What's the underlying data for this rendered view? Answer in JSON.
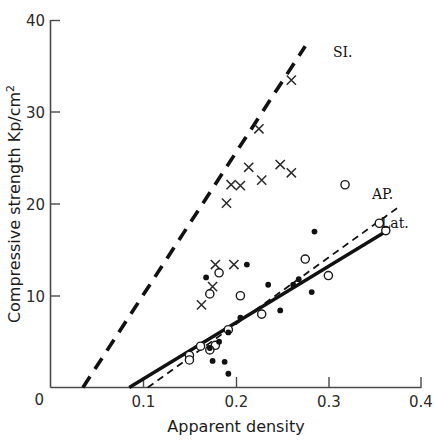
{
  "chart_data": {
    "type": "scatter",
    "title": "",
    "xlabel": "Apparent density",
    "ylabel": "Compressive strength Kp/cm2",
    "ylabel_display": "Compressive strength Kp/cm",
    "ylabel_exponent": "2",
    "xlim": [
      0,
      0.4
    ],
    "ylim": [
      0,
      40
    ],
    "xticks": [
      0,
      0.1,
      0.2,
      0.3,
      0.4
    ],
    "xtick_labels": [
      "0",
      "0.1",
      "0.2",
      "0.3",
      "0.4"
    ],
    "yticks": [
      0,
      10,
      20,
      30,
      40
    ],
    "ytick_labels": [
      "0",
      "10",
      "20",
      "30",
      "40"
    ],
    "grid": false,
    "legend_position": "inline-at-line-ends",
    "series": [
      {
        "name": "SI",
        "label": "SI.",
        "marker": "cross",
        "marker_color": "#2a2a2a",
        "fit_line_style": "long-dash",
        "fit_line_color": "#111111",
        "fit_line_endpoints": [
          [
            0.035,
            0
          ],
          [
            0.275,
            37.2
          ]
        ],
        "points": [
          [
            0.26,
            33.5
          ],
          [
            0.225,
            28.2
          ],
          [
            0.214,
            24.0
          ],
          [
            0.248,
            24.3
          ],
          [
            0.26,
            23.4
          ],
          [
            0.195,
            22.1
          ],
          [
            0.205,
            22.0
          ],
          [
            0.228,
            22.6
          ],
          [
            0.19,
            20.1
          ],
          [
            0.178,
            13.4
          ],
          [
            0.198,
            13.4
          ],
          [
            0.175,
            11.0
          ],
          [
            0.163,
            9.0
          ]
        ]
      },
      {
        "name": "AP",
        "label": "AP.",
        "marker": "open-circle",
        "marker_color": "#1a1a1a",
        "fit_line_style": "short-dash",
        "fit_line_color": "#111111",
        "fit_line_endpoints": [
          [
            0.105,
            0
          ],
          [
            0.375,
            19.6
          ]
        ],
        "points": [
          [
            0.318,
            22.1
          ],
          [
            0.355,
            17.9
          ],
          [
            0.362,
            17.1
          ],
          [
            0.275,
            14.0
          ],
          [
            0.3,
            12.2
          ],
          [
            0.182,
            12.5
          ],
          [
            0.172,
            10.2
          ],
          [
            0.205,
            10.0
          ],
          [
            0.192,
            6.3
          ],
          [
            0.178,
            4.6
          ],
          [
            0.172,
            4.1
          ],
          [
            0.162,
            4.5
          ],
          [
            0.15,
            3.5
          ],
          [
            0.15,
            3.0
          ],
          [
            0.228,
            8.0
          ]
        ]
      },
      {
        "name": "Lat",
        "label": "Lat.",
        "marker": "filled-circle",
        "marker_color": "#111111",
        "fit_line_style": "solid",
        "fit_line_color": "#111111",
        "fit_line_endpoints": [
          [
            0.085,
            0
          ],
          [
            0.362,
            17.0
          ]
        ],
        "points": [
          [
            0.285,
            17.0
          ],
          [
            0.268,
            11.8
          ],
          [
            0.262,
            11.2
          ],
          [
            0.282,
            10.4
          ],
          [
            0.235,
            11.2
          ],
          [
            0.212,
            13.4
          ],
          [
            0.168,
            12.0
          ],
          [
            0.248,
            8.4
          ],
          [
            0.192,
            6.0
          ],
          [
            0.205,
            7.6
          ],
          [
            0.182,
            5.0
          ],
          [
            0.172,
            4.3
          ],
          [
            0.175,
            2.9
          ],
          [
            0.188,
            2.8
          ],
          [
            0.192,
            1.5
          ]
        ]
      }
    ]
  }
}
